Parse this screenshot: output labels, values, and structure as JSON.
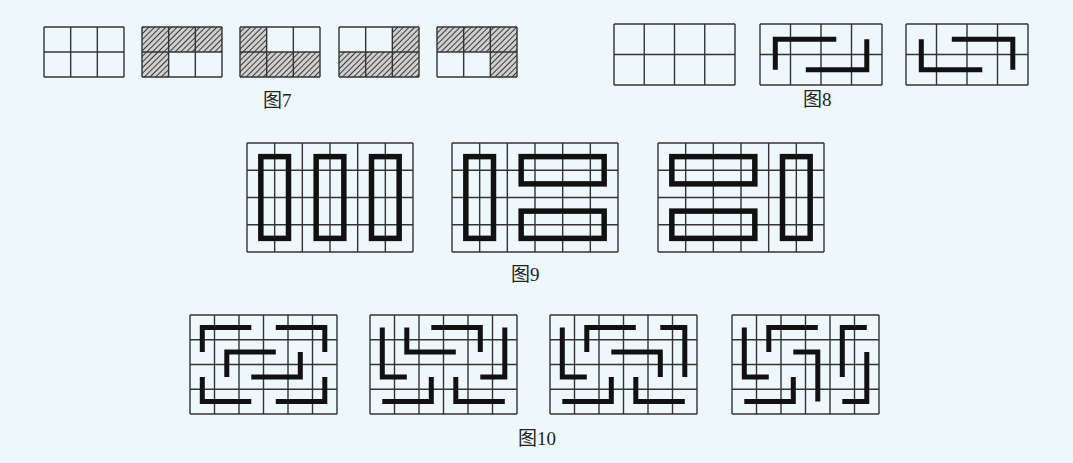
{
  "captions": {
    "fig7": "图7",
    "fig8": "图8",
    "fig9": "图9",
    "fig10": "图10"
  },
  "colors": {
    "background": "#eef8fa",
    "grid_line": "#333333",
    "bold_line": "#111111",
    "hatch": "#444444"
  },
  "fig7": {
    "description": "3x2 grids with hatched cells",
    "cols": 3,
    "rows": 2,
    "grids": [
      {
        "x": 44,
        "y": 27,
        "w": 80,
        "h": 50,
        "shaded": [
          0,
          0,
          0,
          0,
          0,
          0
        ]
      },
      {
        "x": 142,
        "y": 27,
        "w": 80,
        "h": 50,
        "shaded": [
          1,
          1,
          1,
          1,
          0,
          0
        ]
      },
      {
        "x": 240,
        "y": 27,
        "w": 80,
        "h": 50,
        "shaded": [
          1,
          0,
          0,
          1,
          1,
          1
        ]
      },
      {
        "x": 339,
        "y": 27,
        "w": 80,
        "h": 50,
        "shaded": [
          0,
          0,
          1,
          1,
          1,
          1
        ]
      },
      {
        "x": 437,
        "y": 27,
        "w": 80,
        "h": 50,
        "shaded": [
          1,
          1,
          1,
          0,
          0,
          1
        ]
      }
    ]
  },
  "fig8": {
    "description": "4x2 grids with two L-shaped bold paths",
    "cols": 4,
    "rows": 2,
    "grids": [
      {
        "x": 614,
        "y": 24,
        "w": 121,
        "h": 61,
        "paths": []
      },
      {
        "x": 760,
        "y": 24,
        "w": 122,
        "h": 61,
        "paths": [
          [
            [
              0.5,
              1.5
            ],
            [
              0.5,
              0.5
            ],
            [
              2.5,
              0.5
            ]
          ],
          [
            [
              1.5,
              1.5
            ],
            [
              3.5,
              1.5
            ],
            [
              3.5,
              0.5
            ]
          ]
        ]
      },
      {
        "x": 906,
        "y": 24,
        "w": 122,
        "h": 61,
        "paths": [
          [
            [
              0.5,
              0.5
            ],
            [
              0.5,
              1.5
            ],
            [
              2.5,
              1.5
            ]
          ],
          [
            [
              1.5,
              0.5
            ],
            [
              3.5,
              0.5
            ],
            [
              3.5,
              1.5
            ]
          ]
        ]
      }
    ]
  },
  "fig9": {
    "description": "6x4 grids with bold 2x4 rectangles (domino tilings)",
    "cols": 6,
    "rows": 4,
    "grids": [
      {
        "x": 247,
        "y": 143,
        "w": 166,
        "h": 109,
        "rects": [
          [
            0.5,
            0.5,
            1.5,
            3.5
          ],
          [
            2.5,
            0.5,
            3.5,
            3.5
          ],
          [
            4.5,
            0.5,
            5.5,
            3.5
          ]
        ]
      },
      {
        "x": 452,
        "y": 143,
        "w": 166,
        "h": 109,
        "rects": [
          [
            0.5,
            0.5,
            1.5,
            3.5
          ],
          [
            2.5,
            0.5,
            5.5,
            1.5
          ],
          [
            2.5,
            2.5,
            5.5,
            3.5
          ]
        ]
      },
      {
        "x": 658,
        "y": 143,
        "w": 166,
        "h": 109,
        "rects": [
          [
            0.5,
            0.5,
            3.5,
            1.5
          ],
          [
            0.5,
            2.5,
            3.5,
            3.5
          ],
          [
            4.5,
            0.5,
            5.5,
            3.5
          ]
        ]
      }
    ]
  },
  "fig10": {
    "description": "6x4 grids with six L-shaped bold paths",
    "cols": 6,
    "rows": 4,
    "grids": [
      {
        "x": 190,
        "y": 315,
        "w": 147,
        "h": 99,
        "paths": [
          [
            [
              0.5,
              1.5
            ],
            [
              0.5,
              0.5
            ],
            [
              2.5,
              0.5
            ]
          ],
          [
            [
              3.5,
              0.5
            ],
            [
              5.5,
              0.5
            ],
            [
              5.5,
              1.5
            ]
          ],
          [
            [
              1.5,
              2.5
            ],
            [
              1.5,
              1.5
            ],
            [
              3.5,
              1.5
            ]
          ],
          [
            [
              2.5,
              2.5
            ],
            [
              4.5,
              2.5
            ],
            [
              4.5,
              1.5
            ]
          ],
          [
            [
              0.5,
              2.5
            ],
            [
              0.5,
              3.5
            ],
            [
              2.5,
              3.5
            ]
          ],
          [
            [
              3.5,
              3.5
            ],
            [
              5.5,
              3.5
            ],
            [
              5.5,
              2.5
            ]
          ]
        ]
      },
      {
        "x": 370,
        "y": 315,
        "w": 147,
        "h": 99,
        "paths": [
          [
            [
              0.5,
              0.5
            ],
            [
              0.5,
              2.5
            ],
            [
              1.5,
              2.5
            ]
          ],
          [
            [
              1.5,
              0.5
            ],
            [
              1.5,
              1.5
            ],
            [
              3.5,
              1.5
            ]
          ],
          [
            [
              2.5,
              0.5
            ],
            [
              4.5,
              0.5
            ],
            [
              4.5,
              1.5
            ]
          ],
          [
            [
              5.5,
              0.5
            ],
            [
              5.5,
              2.5
            ],
            [
              4.5,
              2.5
            ]
          ],
          [
            [
              0.5,
              3.5
            ],
            [
              2.5,
              3.5
            ],
            [
              2.5,
              2.5
            ]
          ],
          [
            [
              3.5,
              2.5
            ],
            [
              3.5,
              3.5
            ],
            [
              5.5,
              3.5
            ]
          ]
        ]
      },
      {
        "x": 550,
        "y": 315,
        "w": 147,
        "h": 99,
        "paths": [
          [
            [
              0.5,
              0.5
            ],
            [
              0.5,
              2.5
            ],
            [
              1.5,
              2.5
            ]
          ],
          [
            [
              1.5,
              1.5
            ],
            [
              1.5,
              0.5
            ],
            [
              3.5,
              0.5
            ]
          ],
          [
            [
              2.5,
              1.5
            ],
            [
              4.5,
              1.5
            ],
            [
              4.5,
              2.5
            ]
          ],
          [
            [
              4.5,
              0.5
            ],
            [
              5.5,
              0.5
            ],
            [
              5.5,
              2.5
            ]
          ],
          [
            [
              0.5,
              3.5
            ],
            [
              2.5,
              3.5
            ],
            [
              2.5,
              2.5
            ]
          ],
          [
            [
              3.5,
              2.5
            ],
            [
              3.5,
              3.5
            ],
            [
              5.5,
              3.5
            ]
          ]
        ]
      },
      {
        "x": 732,
        "y": 315,
        "w": 147,
        "h": 99,
        "paths": [
          [
            [
              0.5,
              0.5
            ],
            [
              0.5,
              2.5
            ],
            [
              1.5,
              2.5
            ]
          ],
          [
            [
              1.5,
              1.5
            ],
            [
              1.5,
              0.5
            ],
            [
              3.5,
              0.5
            ]
          ],
          [
            [
              2.5,
              1.5
            ],
            [
              3.5,
              1.5
            ],
            [
              3.5,
              3.5
            ]
          ],
          [
            [
              4.5,
              2.5
            ],
            [
              4.5,
              0.5
            ],
            [
              5.5,
              0.5
            ]
          ],
          [
            [
              0.5,
              3.5
            ],
            [
              2.5,
              3.5
            ],
            [
              2.5,
              2.5
            ]
          ],
          [
            [
              5.5,
              1.5
            ],
            [
              5.5,
              3.5
            ],
            [
              4.5,
              3.5
            ]
          ]
        ]
      }
    ]
  }
}
